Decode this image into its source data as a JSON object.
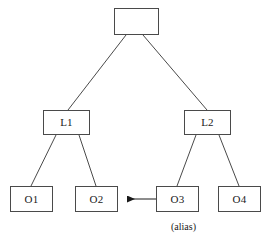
{
  "diagram": {
    "stroke_color": "#4a4a4a",
    "text_color": "#1a1a1a",
    "background_color": "#ffffff",
    "nodes": [
      {
        "id": "root",
        "label": "",
        "x": 114,
        "y": 8,
        "w": 45,
        "h": 27
      },
      {
        "id": "l1",
        "label": "L1",
        "x": 43,
        "y": 110,
        "w": 47,
        "h": 25
      },
      {
        "id": "l2",
        "label": "L2",
        "x": 184,
        "y": 110,
        "w": 47,
        "h": 25
      },
      {
        "id": "o1",
        "label": "O1",
        "x": 10,
        "y": 186,
        "w": 43,
        "h": 26
      },
      {
        "id": "o2",
        "label": "O2",
        "x": 75,
        "y": 186,
        "w": 43,
        "h": 26
      },
      {
        "id": "o3",
        "label": "O3",
        "x": 156,
        "y": 186,
        "w": 43,
        "h": 26
      },
      {
        "id": "o4",
        "label": "O4",
        "x": 218,
        "y": 186,
        "w": 43,
        "h": 26
      }
    ],
    "edges": [
      {
        "id": "root-l1",
        "from": "root",
        "to": "l1",
        "x1": 126,
        "y1": 35,
        "x2": 68,
        "y2": 110,
        "kind": "line"
      },
      {
        "id": "root-l2",
        "from": "root",
        "to": "l2",
        "x1": 143,
        "y1": 35,
        "x2": 207,
        "y2": 110,
        "kind": "line"
      },
      {
        "id": "l1-o1",
        "from": "l1",
        "to": "o1",
        "x1": 56,
        "y1": 135,
        "x2": 31,
        "y2": 186,
        "kind": "line"
      },
      {
        "id": "l1-o2",
        "from": "l1",
        "to": "o2",
        "x1": 79,
        "y1": 135,
        "x2": 96,
        "y2": 186,
        "kind": "line"
      },
      {
        "id": "l2-o3",
        "from": "l2",
        "to": "o3",
        "x1": 196,
        "y1": 135,
        "x2": 177,
        "y2": 186,
        "kind": "line"
      },
      {
        "id": "l2-o4",
        "from": "l2",
        "to": "o4",
        "x1": 219,
        "y1": 135,
        "x2": 239,
        "y2": 186,
        "kind": "line"
      }
    ],
    "arrows": [
      {
        "id": "o3-to-o2-alias",
        "from": "o3",
        "to": "o2",
        "x1": 156,
        "y1": 199,
        "x2": 119,
        "y2": 199,
        "kind": "arrow",
        "direction": "left"
      }
    ],
    "captions": [
      {
        "id": "alias-caption",
        "text": "(alias)",
        "x": 190,
        "y": 228
      }
    ]
  }
}
